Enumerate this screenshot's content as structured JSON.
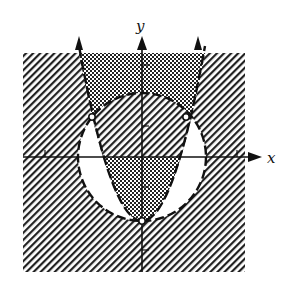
{
  "figure": {
    "type": "inequality-region-graph",
    "axes": {
      "x_label": "x",
      "y_label": "y",
      "x_ticks": [
        -3,
        3
      ],
      "y_ticks": [
        3,
        1,
        -1,
        -3
      ]
    },
    "curves": [
      {
        "name": "circle",
        "equation": "x^2 + y^2 = 4",
        "style": "dashed",
        "center": [
          0,
          0
        ],
        "radius": 2
      },
      {
        "name": "parabola",
        "equation": "y = 2x^2 - 2 (approx.)",
        "style": "dashed",
        "vertex": [
          0,
          -2
        ],
        "opens": "up"
      }
    ],
    "open_points": [
      {
        "label": "left-intersection",
        "approx": [
          -1.5,
          1.3
        ]
      },
      {
        "label": "right-intersection",
        "approx": [
          1.5,
          1.3
        ]
      },
      {
        "label": "parabola-vertex",
        "approx": [
          0,
          -2
        ]
      }
    ],
    "regions": [
      {
        "name": "inside-parabola-outside-circle",
        "fill": "crosshatch"
      },
      {
        "name": "outside-circle-outside-parabola",
        "fill": "diagonal-hatch"
      },
      {
        "name": "inside-circle-inside-parabola",
        "fill": "diagonal-hatch"
      },
      {
        "name": "inside-circle-outside-parabola",
        "fill": "white"
      }
    ],
    "colors": {
      "ink": "#111111",
      "background": "#ffffff"
    }
  }
}
